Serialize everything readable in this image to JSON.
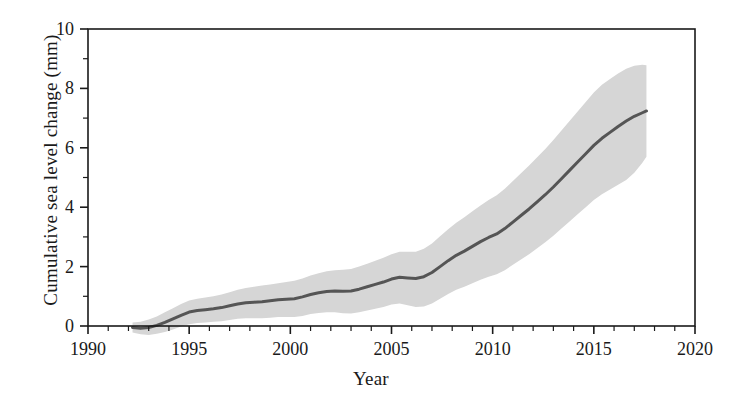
{
  "chart_data": {
    "type": "area",
    "title": "",
    "subtitle": "",
    "xlabel": "Year",
    "ylabel": "Cumulative sea level change (mm)",
    "xlim": [
      1990,
      2020
    ],
    "ylim": [
      0,
      10
    ],
    "xticks": [
      1990,
      1995,
      2000,
      2005,
      2010,
      2015,
      2020
    ],
    "xtick_labels": [
      "1990",
      "1995",
      "2000",
      "2005",
      "2010",
      "2015",
      "2020"
    ],
    "yticks": [
      0,
      2,
      4,
      6,
      8,
      10
    ],
    "ytick_labels": [
      "0",
      "2",
      "4",
      "6",
      "8",
      "10"
    ],
    "minor_xtick_interval": 1,
    "minor_ytick_interval": 1,
    "grid": false,
    "legend": "none",
    "frame": "box",
    "tick_direction": "out",
    "series": [
      {
        "name": "Cumulative sea level change",
        "style": "line-with-uncertainty-band",
        "line_color": "#555555",
        "band_color": "#d6d6d6",
        "x": [
          1992.2,
          1992.6,
          1993.0,
          1993.4,
          1993.8,
          1994.2,
          1994.6,
          1995.0,
          1995.4,
          1995.8,
          1996.2,
          1996.6,
          1997.0,
          1997.4,
          1997.8,
          1998.2,
          1998.6,
          1999.0,
          1999.4,
          1999.8,
          2000.2,
          2000.6,
          2001.0,
          2001.4,
          2001.8,
          2002.2,
          2002.6,
          2003.0,
          2003.4,
          2003.8,
          2004.2,
          2004.6,
          2005.0,
          2005.4,
          2005.8,
          2006.2,
          2006.6,
          2007.0,
          2007.4,
          2007.8,
          2008.2,
          2008.6,
          2009.0,
          2009.4,
          2009.8,
          2010.2,
          2010.6,
          2011.0,
          2011.4,
          2011.8,
          2012.2,
          2012.6,
          2013.0,
          2013.4,
          2013.8,
          2014.2,
          2014.6,
          2015.0,
          2015.4,
          2015.8,
          2016.2,
          2016.6,
          2017.0,
          2017.4,
          2017.6
        ],
        "y": [
          -0.05,
          -0.08,
          -0.05,
          0.02,
          0.12,
          0.24,
          0.36,
          0.47,
          0.52,
          0.55,
          0.58,
          0.62,
          0.68,
          0.74,
          0.78,
          0.8,
          0.82,
          0.85,
          0.88,
          0.9,
          0.92,
          0.98,
          1.06,
          1.12,
          1.16,
          1.18,
          1.17,
          1.18,
          1.24,
          1.32,
          1.4,
          1.48,
          1.58,
          1.64,
          1.62,
          1.6,
          1.66,
          1.8,
          2.0,
          2.2,
          2.38,
          2.52,
          2.68,
          2.84,
          2.98,
          3.1,
          3.28,
          3.5,
          3.72,
          3.94,
          4.18,
          4.42,
          4.68,
          4.96,
          5.24,
          5.52,
          5.8,
          6.08,
          6.32,
          6.52,
          6.72,
          6.9,
          7.06,
          7.18,
          7.24
        ],
        "y_lower": [
          -0.22,
          -0.28,
          -0.3,
          -0.26,
          -0.2,
          -0.12,
          -0.02,
          0.06,
          0.1,
          0.12,
          0.14,
          0.16,
          0.2,
          0.24,
          0.26,
          0.26,
          0.26,
          0.28,
          0.3,
          0.3,
          0.3,
          0.34,
          0.4,
          0.44,
          0.46,
          0.46,
          0.43,
          0.42,
          0.46,
          0.52,
          0.58,
          0.64,
          0.72,
          0.76,
          0.7,
          0.64,
          0.66,
          0.76,
          0.92,
          1.08,
          1.22,
          1.32,
          1.44,
          1.56,
          1.66,
          1.74,
          1.88,
          2.06,
          2.24,
          2.42,
          2.62,
          2.82,
          3.04,
          3.28,
          3.52,
          3.76,
          4.0,
          4.24,
          4.44,
          4.6,
          4.76,
          4.92,
          5.16,
          5.5,
          5.7
        ],
        "y_upper": [
          0.12,
          0.14,
          0.22,
          0.32,
          0.46,
          0.6,
          0.74,
          0.86,
          0.92,
          0.96,
          1.0,
          1.06,
          1.14,
          1.22,
          1.28,
          1.32,
          1.36,
          1.4,
          1.44,
          1.48,
          1.52,
          1.6,
          1.7,
          1.78,
          1.84,
          1.88,
          1.89,
          1.92,
          2.0,
          2.1,
          2.2,
          2.3,
          2.42,
          2.5,
          2.5,
          2.5,
          2.6,
          2.78,
          3.02,
          3.26,
          3.48,
          3.66,
          3.86,
          4.06,
          4.24,
          4.4,
          4.62,
          4.88,
          5.14,
          5.4,
          5.68,
          5.96,
          6.26,
          6.58,
          6.9,
          7.22,
          7.54,
          7.86,
          8.12,
          8.32,
          8.5,
          8.66,
          8.76,
          8.8,
          8.78
        ]
      }
    ]
  },
  "colors": {
    "axis": "#1a1a1a",
    "line": "#555555",
    "band": "#d6d6d6",
    "background": "#ffffff"
  }
}
